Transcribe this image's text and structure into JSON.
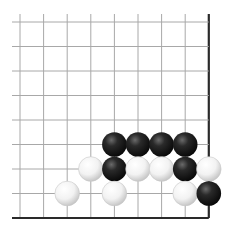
{
  "board": {
    "cols": 9,
    "rows": 9,
    "origin_x": 20,
    "origin_y": 22,
    "step_x": 23.6,
    "step_y": 24.5,
    "open_extension": 8,
    "edges": {
      "right": true,
      "bottom": true,
      "left": false,
      "top": false
    },
    "colors": {
      "background": "#ffffff",
      "grid_line": "#a8a8a8",
      "edge_line": "#2a2a2a"
    },
    "stone_radius": 12.3
  },
  "stones": [
    {
      "color": "black",
      "col": 4,
      "row": 5
    },
    {
      "color": "black",
      "col": 5,
      "row": 5
    },
    {
      "color": "black",
      "col": 6,
      "row": 5
    },
    {
      "color": "black",
      "col": 7,
      "row": 5
    },
    {
      "color": "white",
      "col": 3,
      "row": 6
    },
    {
      "color": "black",
      "col": 4,
      "row": 6
    },
    {
      "color": "white",
      "col": 5,
      "row": 6
    },
    {
      "color": "white",
      "col": 6,
      "row": 6
    },
    {
      "color": "black",
      "col": 7,
      "row": 6
    },
    {
      "color": "white",
      "col": 8,
      "row": 6
    },
    {
      "color": "white",
      "col": 2,
      "row": 7
    },
    {
      "color": "white",
      "col": 4,
      "row": 7
    },
    {
      "color": "white",
      "col": 7,
      "row": 7
    },
    {
      "color": "black",
      "col": 8,
      "row": 7
    }
  ]
}
